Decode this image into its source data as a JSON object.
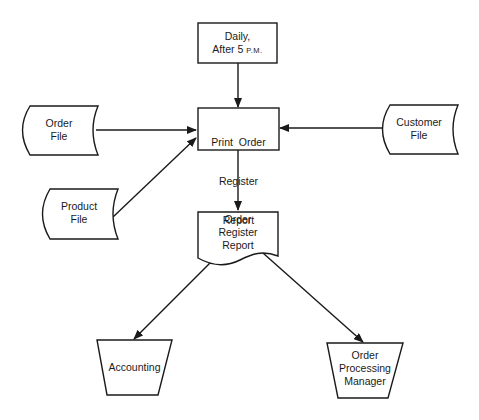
{
  "diagram": {
    "type": "system flowchart",
    "colors": {
      "stroke": "#1a1a1a",
      "background": "#ffffff"
    },
    "nodes": {
      "trigger": {
        "shape": "process-box",
        "line1": "Daily,",
        "line2_main": "After 5 ",
        "line2_small": "P.M."
      },
      "process": {
        "shape": "process-box",
        "lines": [
          "Print  Order",
          "Register",
          "Report"
        ]
      },
      "order_file": {
        "shape": "stored-data",
        "lines": [
          "Order",
          "File"
        ]
      },
      "product_file": {
        "shape": "stored-data",
        "lines": [
          "Product",
          "File"
        ]
      },
      "customer_file": {
        "shape": "stored-data",
        "lines": [
          "Customer",
          "File"
        ]
      },
      "report": {
        "shape": "document",
        "lines": [
          "Order",
          "Register",
          "Report"
        ]
      },
      "accounting": {
        "shape": "manual-operation",
        "lines": [
          "Accounting"
        ]
      },
      "manager": {
        "shape": "manual-operation",
        "lines": [
          "Order",
          "Processing",
          "Manager"
        ]
      }
    },
    "edges": [
      {
        "from": "Daily, After 5 P.M.",
        "to": "Print Order Register Report"
      },
      {
        "from": "Order File",
        "to": "Print Order Register Report"
      },
      {
        "from": "Product File",
        "to": "Print Order Register Report"
      },
      {
        "from": "Customer File",
        "to": "Print Order Register Report"
      },
      {
        "from": "Print Order Register Report",
        "to": "Order Register Report"
      },
      {
        "from": "Order Register Report",
        "to": "Accounting"
      },
      {
        "from": "Order Register Report",
        "to": "Order Processing Manager"
      }
    ]
  }
}
